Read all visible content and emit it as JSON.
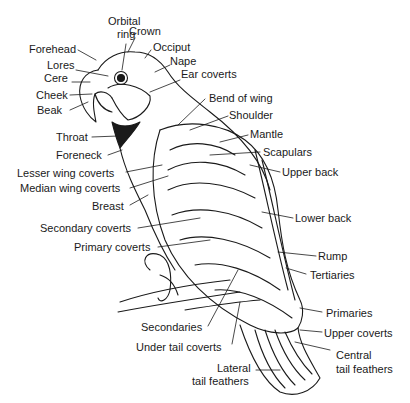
{
  "diagram": {
    "line_color": "#1a1a1a",
    "labels": {
      "orbital_ring_1": "Orbital",
      "orbital_ring_2": "ring",
      "crown": "Crown",
      "occiput": "Occiput",
      "forehead": "Forehead",
      "nape": "Nape",
      "lores": "Lores",
      "ear_coverts": "Ear coverts",
      "cere": "Cere",
      "cheek": "Cheek",
      "beak": "Beak",
      "bend_of_wing": "Bend of wing",
      "shoulder": "Shoulder",
      "mantle": "Mantle",
      "throat": "Throat",
      "scapulars": "Scapulars",
      "foreneck": "Foreneck",
      "upper_back": "Upper back",
      "lesser_wing_coverts": "Lesser wing coverts",
      "median_wing_coverts": "Median wing coverts",
      "breast": "Breast",
      "lower_back": "Lower back",
      "secondary_coverts": "Secondary coverts",
      "primary_coverts": "Primary coverts",
      "rump": "Rump",
      "tertiaries": "Tertiaries",
      "primaries": "Primaries",
      "secondaries": "Secondaries",
      "upper_coverts": "Upper coverts",
      "under_tail_coverts": "Under tail coverts",
      "central_tail_feathers_1": "Central",
      "central_tail_feathers_2": "tail feathers",
      "lateral_tail_feathers_1": "Lateral",
      "lateral_tail_feathers_2": "tail feathers"
    }
  }
}
